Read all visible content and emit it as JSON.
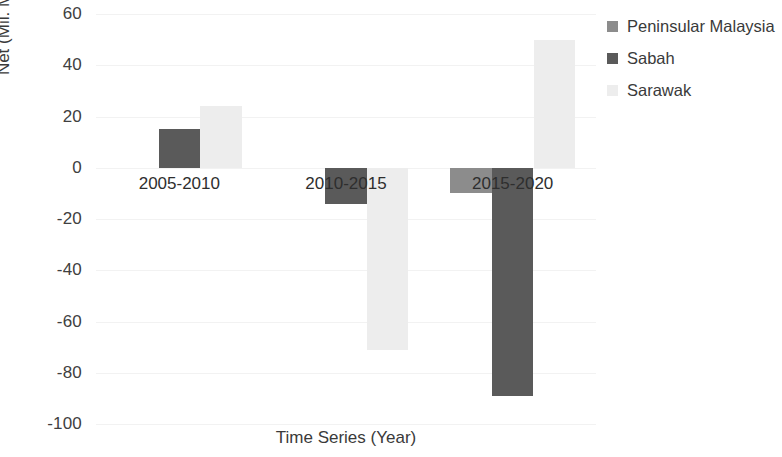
{
  "chart_data": {
    "type": "bar",
    "title": "",
    "subtitle": "",
    "xlabel": "Time Series (Year)",
    "ylabel": "Net (Mil. Mg CO2)",
    "ylabel_parts": {
      "prefix": "Net (Mil. Mg CO",
      "sub": "2",
      "suffix": ")"
    },
    "categories": [
      "2005-2010",
      "2010-2015",
      "2015-2020"
    ],
    "series": [
      {
        "name": "Peninsular Malaysia",
        "color": "#8c8c8c",
        "values": [
          0,
          0,
          -10
        ]
      },
      {
        "name": "Sabah",
        "color": "#5a5a5a",
        "values": [
          15,
          -14,
          -89
        ]
      },
      {
        "name": "Sarawak",
        "color": "#ededed",
        "values": [
          24,
          -71,
          50
        ]
      }
    ],
    "ylim": [
      -100,
      60
    ],
    "yticks": [
      60,
      40,
      20,
      0,
      -20,
      -40,
      -60,
      -80,
      -100
    ],
    "ytick_labels": [
      "60",
      "40",
      "20",
      "0",
      "-20",
      "-40",
      "-60",
      "-80",
      "-100"
    ],
    "grid": true,
    "grid_axis": "y",
    "legend_position": "right",
    "bar_group_gap": 0.25
  },
  "legend": {
    "items": [
      {
        "label": "Peninsular Malaysia",
        "color": "#8c8c8c"
      },
      {
        "label": "Sabah",
        "color": "#5a5a5a"
      },
      {
        "label": "Sarawak",
        "color": "#ededed"
      }
    ]
  }
}
